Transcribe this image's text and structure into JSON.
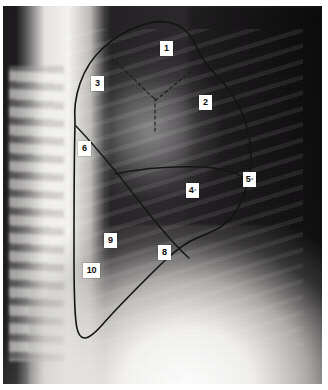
{
  "figure": {
    "kind": "lateral-chest-radiograph",
    "background_color": "#1a181a",
    "label_chip_color": "#fdfdfb",
    "label_text_color": "#0d0d0d",
    "outline_color": "#141414"
  },
  "labels": [
    {
      "id": "label-1",
      "text": "1",
      "sup": "",
      "x": 160,
      "y": 41,
      "width": "w1"
    },
    {
      "id": "label-2",
      "text": "2",
      "sup": "",
      "x": 199,
      "y": 95,
      "width": "w1"
    },
    {
      "id": "label-3",
      "text": "3",
      "sup": "",
      "x": 91,
      "y": 76,
      "width": "w1"
    },
    {
      "id": "label-4",
      "text": "4",
      "sup": "°",
      "x": 186,
      "y": 183,
      "width": "w1"
    },
    {
      "id": "label-5",
      "text": "5",
      "sup": "°",
      "x": 243,
      "y": 172,
      "width": "w1"
    },
    {
      "id": "label-6",
      "text": "6",
      "sup": "",
      "x": 78,
      "y": 141,
      "width": "w1"
    },
    {
      "id": "label-8",
      "text": "8",
      "sup": "",
      "x": 158,
      "y": 245,
      "width": "w1"
    },
    {
      "id": "label-9",
      "text": "9",
      "sup": "",
      "x": 104,
      "y": 233,
      "width": "w1"
    },
    {
      "id": "label-10",
      "text": "10",
      "sup": "",
      "x": 83,
      "y": 263,
      "width": "w2"
    }
  ],
  "outlines": {
    "lung_border": "M 72 116 C 70 92 78 62 100 42 C 122 22 148 14 163 16 C 178 18 188 28 193 40 C 198 52 204 60 214 70 C 228 84 240 104 245 126 C 250 148 248 168 242 186 C 236 204 226 216 216 222 C 206 228 196 230 186 236 C 172 244 160 256 144 272 C 128 288 112 304 100 318 C 92 327 86 332 82 332 C 77 332 74 326 73 316 C 71 300 71 276 71 246 C 71 206 71 160 72 116 Z",
    "oblique_fissure": "M 73 120 C 92 140 112 164 132 190 C 152 216 170 238 186 252",
    "horizontal_fissure": "M 112 168 C 140 162 172 160 200 161 C 218 162 232 166 241 172",
    "apical_dash_left": "M 109 53 C 120 62 130 72 140 82 C 145 87 148 90 151 92",
    "apical_dash_right": "M 188 66 C 180 72 172 78 164 85 C 158 90 154 93 152 95",
    "vertical_dash": "M 152 92 C 152 104 152 116 152 128"
  }
}
